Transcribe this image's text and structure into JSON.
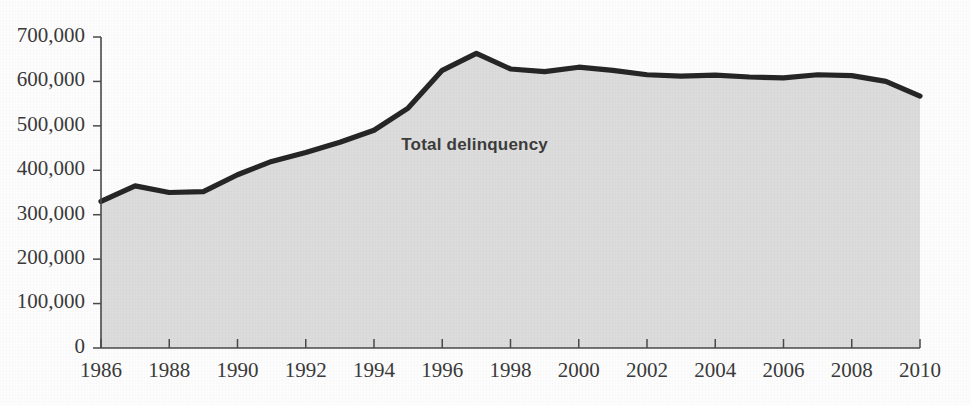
{
  "chart_data": {
    "type": "area",
    "title": "",
    "xlabel": "",
    "ylabel": "",
    "grid": false,
    "legend_position": "inline-annotation",
    "annotations": [
      {
        "text": "Total delinquency",
        "x": 1994.8,
        "y": 455000
      }
    ],
    "xlim": [
      1986,
      2010
    ],
    "ylim": [
      0,
      700000
    ],
    "ytick_labels": [
      "700,000",
      "600,000",
      "500,000",
      "400,000",
      "300,000",
      "200,000",
      "100,000",
      "0"
    ],
    "ytick_values": [
      700000,
      600000,
      500000,
      400000,
      300000,
      200000,
      100000,
      0
    ],
    "xtick_labels": [
      "1986",
      "1988",
      "1990",
      "1992",
      "1994",
      "1996",
      "1998",
      "2000",
      "2002",
      "2004",
      "2006",
      "2008",
      "2010"
    ],
    "xtick_values": [
      1986,
      1988,
      1990,
      1992,
      1994,
      1996,
      1998,
      2000,
      2002,
      2004,
      2006,
      2008,
      2010
    ],
    "x": [
      1986,
      1987,
      1988,
      1989,
      1990,
      1991,
      1992,
      1993,
      1994,
      1995,
      1996,
      1997,
      1998,
      1999,
      2000,
      2001,
      2002,
      2003,
      2004,
      2005,
      2006,
      2007,
      2008,
      2009,
      2010
    ],
    "series": [
      {
        "name": "Total delinquency",
        "color": "#262626",
        "fill_color": "#dcdcdc",
        "values": [
          330000,
          365000,
          350000,
          352000,
          390000,
          420000,
          440000,
          463000,
          490000,
          540000,
          625000,
          663000,
          628000,
          622000,
          632000,
          625000,
          615000,
          612000,
          614000,
          610000,
          608000,
          615000,
          613000,
          600000,
          567000
        ]
      }
    ]
  },
  "figure": {
    "background_color": "#fdfdfd",
    "axis_color": "#4a4a4a"
  }
}
